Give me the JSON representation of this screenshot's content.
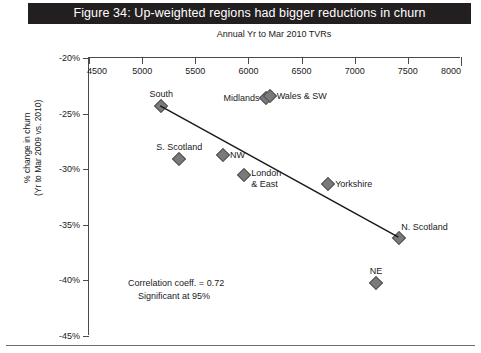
{
  "figure": {
    "title": "Figure 34: Up-weighted regions had bigger reductions in churn",
    "title_bg": "#231f20",
    "title_color": "#ffffff"
  },
  "chart_data": {
    "type": "scatter",
    "title": "Figure 34: Up-weighted regions had bigger reductions in churn",
    "subtitle": "Annual Yr to Mar 2010 TVRs",
    "xlabel": "Annual Yr to Mar 2010 TVRs",
    "ylabel": "% change in churn (Yr to Mar 2009 vs. 2010)",
    "ylabel_line1": "% change in churn",
    "ylabel_line2": "(Yr to Mar 2009 vs. 2010)",
    "xlim": [
      4500,
      8000
    ],
    "ylim": [
      -45,
      -20
    ],
    "x_axis_position": "top",
    "grid": false,
    "legend": false,
    "xticks": [
      4500,
      5000,
      5500,
      6000,
      6500,
      7000,
      7500,
      8000
    ],
    "xtick_labels": [
      "4500",
      "5000",
      "5500",
      "6000",
      "6500",
      "7000",
      "7500",
      "8000"
    ],
    "yticks": [
      -20,
      -25,
      -30,
      -35,
      -40,
      -45
    ],
    "ytick_labels": [
      "-20%",
      "-25%",
      "-30%",
      "-35%",
      "-40%",
      "-45%"
    ],
    "points": [
      {
        "label": "South",
        "x": 5180,
        "y": -24.3,
        "label_pos": "above"
      },
      {
        "label": "S. Scotland",
        "x": 5350,
        "y": -29.1,
        "label_pos": "above"
      },
      {
        "label": "Midlands",
        "x": 6170,
        "y": -23.6,
        "label_pos": "left"
      },
      {
        "label": "Wales & SW",
        "x": 6200,
        "y": -23.4,
        "label_pos": "right"
      },
      {
        "label": "NW",
        "x": 5760,
        "y": -28.7,
        "label_pos": "right"
      },
      {
        "label": "London & East",
        "x": 5960,
        "y": -30.5,
        "label_pos": "right"
      },
      {
        "label": "Yorkshire",
        "x": 6750,
        "y": -31.3,
        "label_pos": "right"
      },
      {
        "label": "N. Scotland",
        "x": 7420,
        "y": -36.2,
        "label_pos": "aboveright"
      },
      {
        "label": "NE",
        "x": 7200,
        "y": -40.2,
        "label_pos": "above"
      }
    ],
    "trendline": {
      "x1": 5180,
      "y1": -24.4,
      "x2": 7420,
      "y2": -36.2
    },
    "annotations": [
      "Correlation coeff. = 0.72",
      "Significant at 95%"
    ],
    "correlation_coefficient": 0.72,
    "significance": "95%",
    "marker_color": "#7a7a7a",
    "marker_shape": "diamond",
    "line_color": "#1a1a1a"
  }
}
